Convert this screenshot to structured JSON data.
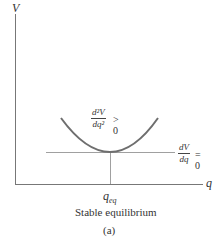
{
  "axes": {
    "y_label": "V",
    "x_label": "q"
  },
  "curve": {
    "color": "#6e6e6e",
    "annotation": {
      "numerator": "d²V",
      "denominator": "dq²",
      "relation": "> 0"
    }
  },
  "tangent": {
    "annotation": {
      "numerator": "dV",
      "denominator": "dq",
      "relation": "= 0"
    }
  },
  "equilibrium": {
    "label_main": "q",
    "label_sub": "eq"
  },
  "caption": {
    "title": "Stable equilibrium",
    "sublabel": "(a)"
  }
}
